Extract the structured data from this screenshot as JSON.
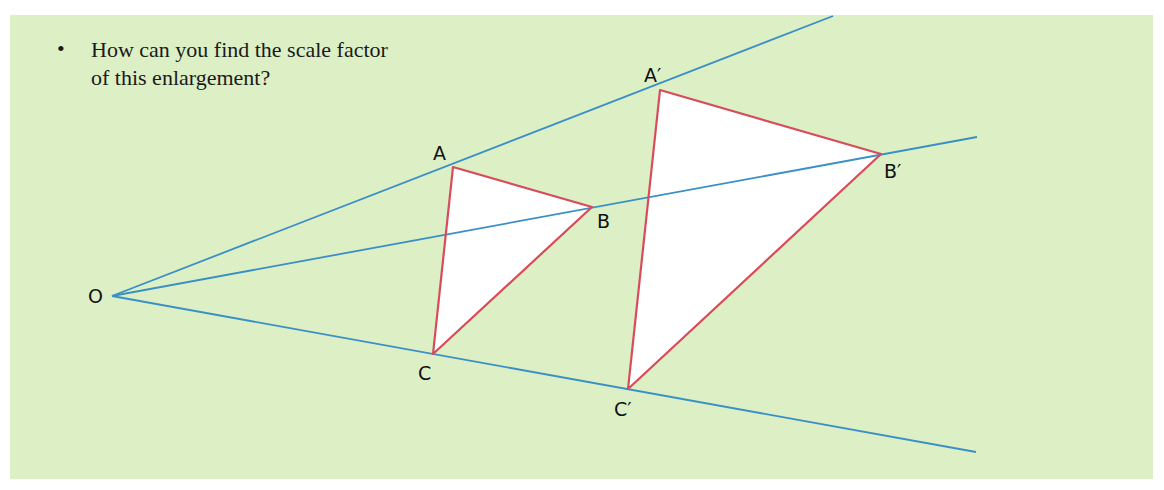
{
  "question": {
    "bullet": "•",
    "lines": [
      "How can you find the scale factor",
      "of this enlargement?"
    ]
  },
  "diagram": {
    "colors": {
      "background": "#dcefc5",
      "rays": "#3a8fc6",
      "triangle_edges": "#d94a5a",
      "triangle_fill": "#ffffff"
    },
    "labels": {
      "O": "O",
      "A": "A",
      "B": "B",
      "C": "C",
      "A_prime": "A′",
      "B_prime": "B′",
      "C_prime": "C′"
    }
  }
}
